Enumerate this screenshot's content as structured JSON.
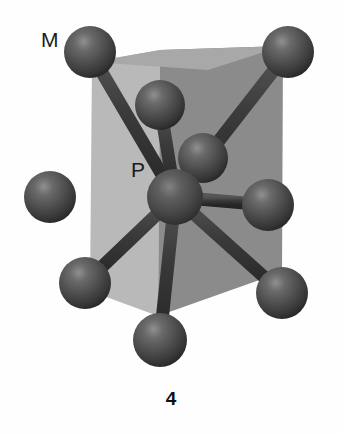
{
  "figure": {
    "caption": "4",
    "labels": {
      "metal": "M",
      "center": "P"
    },
    "colors": {
      "background": "#fefefe",
      "prism_face_light": "#b9b9b9",
      "prism_face_dark": "#8b8b8b",
      "prism_face_top": "#a6a6a6",
      "sphere_base": "#4a4a4a",
      "sphere_shadow": "#242424",
      "sphere_highlight": "#8e8e8e",
      "bond": "#3a3a3a",
      "label_text": "#1b1b1b",
      "caption_text": "#101010"
    }
  },
  "structure": {
    "type": "ball-and-stick",
    "center_atom": {
      "name": "P",
      "element_label": "P",
      "x": 175,
      "y": 197,
      "r": 28
    },
    "ligand_atoms": [
      {
        "name": "M-top-left",
        "element_label": "M",
        "x": 90,
        "y": 52,
        "r": 26
      },
      {
        "name": "M-top-right",
        "element_label": "M",
        "x": 288,
        "y": 52,
        "r": 26
      },
      {
        "name": "M-top-inner",
        "element_label": "M",
        "x": 160,
        "y": 105,
        "r": 25
      },
      {
        "name": "M-mid-inner",
        "element_label": "M",
        "x": 203,
        "y": 158,
        "r": 25
      },
      {
        "name": "M-mid-left",
        "element_label": "M",
        "x": 50,
        "y": 197,
        "r": 26
      },
      {
        "name": "M-mid-right",
        "element_label": "M",
        "x": 268,
        "y": 205,
        "r": 26
      },
      {
        "name": "M-bottom-left",
        "element_label": "M",
        "x": 85,
        "y": 283,
        "r": 26
      },
      {
        "name": "M-bottom-right",
        "element_label": "M",
        "x": 282,
        "y": 293,
        "r": 26
      },
      {
        "name": "M-bottom-center",
        "element_label": "M",
        "x": 160,
        "y": 340,
        "r": 27
      }
    ],
    "bonds": [
      {
        "from": "P",
        "to": "M-top-left",
        "x1": 175,
        "y1": 197,
        "x2": 90,
        "y2": 52
      },
      {
        "from": "P",
        "to": "M-top-right",
        "x1": 175,
        "y1": 197,
        "x2": 288,
        "y2": 52
      },
      {
        "from": "P",
        "to": "M-top-inner",
        "x1": 175,
        "y1": 197,
        "x2": 160,
        "y2": 105
      },
      {
        "from": "P",
        "to": "M-mid-inner",
        "x1": 175,
        "y1": 197,
        "x2": 203,
        "y2": 158
      },
      {
        "from": "P",
        "to": "M-mid-left",
        "x1": 175,
        "y1": 197,
        "x2": 50,
        "y2": 197
      },
      {
        "from": "P",
        "to": "M-mid-right",
        "x1": 175,
        "y1": 197,
        "x2": 268,
        "y2": 205
      },
      {
        "from": "P",
        "to": "M-bottom-left",
        "x1": 175,
        "y1": 197,
        "x2": 85,
        "y2": 283
      },
      {
        "from": "P",
        "to": "M-bottom-right",
        "x1": 175,
        "y1": 197,
        "x2": 282,
        "y2": 293
      },
      {
        "from": "P",
        "to": "M-bottom-center",
        "x1": 175,
        "y1": 197,
        "x2": 160,
        "y2": 340
      }
    ],
    "prism_faces": [
      {
        "name": "prism-face-left",
        "shade": "light",
        "points": "92,62 160,50 158,316 90,291"
      },
      {
        "name": "prism-face-right",
        "shade": "dark",
        "points": "160,50 283,46 282,272 158,316"
      },
      {
        "name": "prism-face-top",
        "shade": "top",
        "points": "92,62 160,50 283,46 205,68"
      }
    ]
  }
}
